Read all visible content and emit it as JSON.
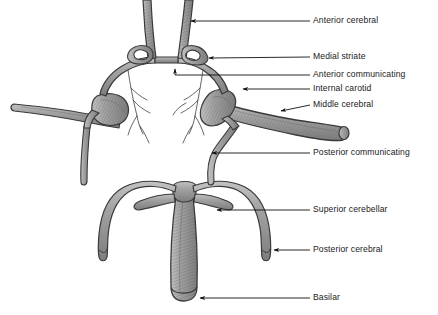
{
  "diagram": {
    "style": {
      "background": "#ffffff",
      "vessel_fill": "#9a9a9a",
      "vessel_fill_light": "#b4b4b4",
      "vessel_outline": "#3a3a3a",
      "shading": "#5e5e5e",
      "leader_line": "#1a1a1a",
      "text_color": "#1a1a1a"
    },
    "labels": [
      {
        "id": "anterior-cerebral",
        "text": "Anterior cerebral",
        "text_x": 313,
        "text_y": 21,
        "line_x1": 310,
        "line_y1": 21,
        "arrow_x": 188,
        "arrow_y": 21,
        "arrow_dir": "left"
      },
      {
        "id": "medial-striate",
        "text": "Medial striate",
        "text_x": 313,
        "text_y": 57,
        "line_x1": 310,
        "line_y1": 57,
        "arrow_x": 206,
        "arrow_y": 59,
        "arrow_dir": "left"
      },
      {
        "id": "anterior-communicating",
        "text": "Anterior communicating",
        "text_x": 313,
        "text_y": 75,
        "line_x1": 310,
        "line_y1": 75,
        "arrow_x": 172,
        "arrow_y": 69,
        "arrow_dir": "left-up"
      },
      {
        "id": "internal-carotid",
        "text": "Internal carotid",
        "text_x": 313,
        "text_y": 89,
        "line_x1": 310,
        "line_y1": 89,
        "arrow_x": 240,
        "arrow_y": 89,
        "arrow_dir": "left"
      },
      {
        "id": "middle-cerebral",
        "text": "Middle cerebral",
        "text_x": 313,
        "text_y": 105,
        "line_x1": 310,
        "line_y1": 105,
        "arrow_x": 279,
        "arrow_y": 112,
        "arrow_dir": "left-down"
      },
      {
        "id": "posterior-communicating",
        "text": "Posterior communicating",
        "text_x": 313,
        "text_y": 153,
        "line_x1": 310,
        "line_y1": 153,
        "arrow_x": 209,
        "arrow_y": 153,
        "arrow_dir": "left"
      },
      {
        "id": "superior-cerebellar",
        "text": "Superior cerebellar",
        "text_x": 313,
        "text_y": 210,
        "line_x1": 310,
        "line_y1": 210,
        "arrow_x": 214,
        "arrow_y": 210,
        "arrow_dir": "left"
      },
      {
        "id": "posterior-cerebral",
        "text": "Posterior cerebral",
        "text_x": 313,
        "text_y": 250,
        "line_x1": 310,
        "line_y1": 250,
        "arrow_x": 271,
        "arrow_y": 250,
        "arrow_dir": "left"
      },
      {
        "id": "basilar",
        "text": "Basilar",
        "text_x": 313,
        "text_y": 298,
        "line_x1": 310,
        "line_y1": 298,
        "arrow_x": 197,
        "arrow_y": 298,
        "arrow_dir": "left"
      }
    ],
    "vessels": [
      {
        "id": "anterior-cerebral-left",
        "name": "Anterior cerebral artery (left)"
      },
      {
        "id": "anterior-cerebral-right",
        "name": "Anterior cerebral artery (right)"
      },
      {
        "id": "medial-striate-left",
        "name": "Medial striate artery (left)"
      },
      {
        "id": "medial-striate-right",
        "name": "Medial striate artery (right)"
      },
      {
        "id": "anterior-communicating",
        "name": "Anterior communicating artery"
      },
      {
        "id": "internal-carotid-left",
        "name": "Internal carotid artery (left)"
      },
      {
        "id": "internal-carotid-right",
        "name": "Internal carotid artery (right)"
      },
      {
        "id": "middle-cerebral-left",
        "name": "Middle cerebral artery (left)"
      },
      {
        "id": "middle-cerebral-right",
        "name": "Middle cerebral artery (right)"
      },
      {
        "id": "posterior-communicating-left",
        "name": "Posterior communicating artery (left)"
      },
      {
        "id": "posterior-communicating-right",
        "name": "Posterior communicating artery (right)"
      },
      {
        "id": "posterior-cerebral-left",
        "name": "Posterior cerebral artery (left)"
      },
      {
        "id": "posterior-cerebral-right",
        "name": "Posterior cerebral artery (right)"
      },
      {
        "id": "superior-cerebellar-left",
        "name": "Superior cerebellar artery (left)"
      },
      {
        "id": "superior-cerebellar-right",
        "name": "Superior cerebellar artery (right)"
      },
      {
        "id": "basilar",
        "name": "Basilar artery"
      }
    ]
  }
}
